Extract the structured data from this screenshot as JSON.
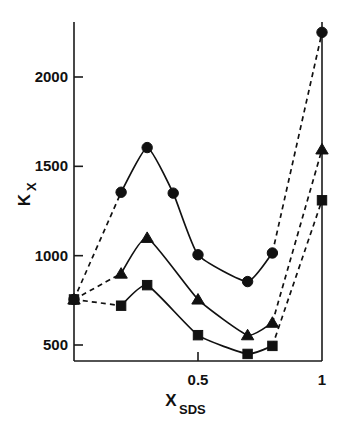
{
  "figure": {
    "title": "",
    "y_axis_label_main": "K",
    "y_axis_label_sub": "X",
    "x_axis_label_main": "X",
    "x_axis_label_sub": "SDS",
    "ink_color": "#111111"
  },
  "chart_data": {
    "type": "line",
    "title": "",
    "xlabel": "X_SDS",
    "ylabel": "K_X",
    "xlim": [
      0,
      1
    ],
    "ylim": [
      380,
      2320
    ],
    "grid": false,
    "legend": "none",
    "x_ticks": [
      0.5,
      1
    ],
    "x_tick_labels": [
      "0.5",
      "1"
    ],
    "y_ticks": [
      500,
      1000,
      1500,
      2000
    ],
    "y_tick_labels": [
      "500",
      "1000",
      "1500",
      "2000"
    ],
    "series": [
      {
        "name": "circles",
        "marker": "circle",
        "x": [
          0.0,
          0.19,
          0.295,
          0.4,
          0.5,
          0.7,
          0.8,
          1.0
        ],
        "values": [
          755,
          1355,
          1605,
          1350,
          1005,
          855,
          1015,
          2250
        ],
        "segments": [
          {
            "style": "dashed",
            "from_index": 0,
            "to_index": 1
          },
          {
            "style": "solid",
            "from_index": 1,
            "to_index": 6
          },
          {
            "style": "dashed",
            "from_index": 6,
            "to_index": 7
          }
        ]
      },
      {
        "name": "triangles",
        "marker": "triangle",
        "x": [
          0.0,
          0.19,
          0.295,
          0.5,
          0.7,
          0.8,
          1.0
        ],
        "values": [
          755,
          900,
          1100,
          755,
          555,
          625,
          1595
        ],
        "segments": [
          {
            "style": "dashed",
            "from_index": 0,
            "to_index": 1
          },
          {
            "style": "solid",
            "from_index": 1,
            "to_index": 5
          },
          {
            "style": "dashed",
            "from_index": 5,
            "to_index": 6
          }
        ]
      },
      {
        "name": "squares",
        "marker": "square",
        "x": [
          0.0,
          0.19,
          0.295,
          0.5,
          0.7,
          0.8,
          1.0
        ],
        "values": [
          755,
          720,
          835,
          555,
          450,
          495,
          1310
        ],
        "segments": [
          {
            "style": "dashed",
            "from_index": 0,
            "to_index": 1
          },
          {
            "style": "solid",
            "from_index": 1,
            "to_index": 5
          },
          {
            "style": "dashed",
            "from_index": 5,
            "to_index": 6
          }
        ]
      }
    ]
  }
}
